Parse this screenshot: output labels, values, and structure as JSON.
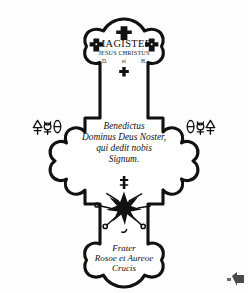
{
  "image": {
    "kind": "line-drawing",
    "subject": "rosicrucian-cross-emblem",
    "background_color": "#fdfdfd",
    "ink_color": "#111111"
  },
  "top_arm": {
    "top_cross_icon": "cross-pattee-icon",
    "left_cross_icon": "cross-pattee-icon",
    "right_cross_icon": "cross-pattee-icon",
    "title": "MAGISTER",
    "subtitle": "JESUS CHRISTUS",
    "initials": {
      "left": "D.",
      "middle": "et",
      "right": "H."
    },
    "small_cross_icon": "latin-cross-icon"
  },
  "left_arm": {
    "symbols": [
      "sulphur-symbol",
      "mercury-symbol",
      "saturn-symbol"
    ]
  },
  "right_arm": {
    "symbols": [
      "saturn-symbol",
      "mercury-symbol",
      "sulphur-symbol"
    ]
  },
  "center": {
    "lines": [
      "Benedictus",
      "Dominus Deus Noster,",
      "qui dedit nobis",
      "Signum."
    ]
  },
  "bottom_arm": {
    "star_icon": "radiant-star-icon",
    "star_cross_icon": "small-cross-icon",
    "lines": [
      "Frater",
      "Rosoe et Aureoe",
      "Crucis"
    ]
  },
  "corner": {
    "artifact": "page-corner-artifact"
  }
}
